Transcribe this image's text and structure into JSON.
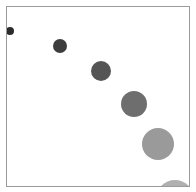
{
  "figure": {
    "background_color": "#ffffff",
    "width": 196,
    "height": 192
  },
  "plot_frame": {
    "border_color": "#9b9b9b",
    "border_width": 1,
    "x": 6,
    "y": 6,
    "width": 184,
    "height": 181,
    "background_color": "#ffffff"
  },
  "chart_data": {
    "type": "scatter",
    "title": "",
    "subtitle": "",
    "xlabel": "",
    "ylabel": "",
    "grid": false,
    "legend": "none",
    "axis_ticks": "none",
    "axis_tick_labels": "none",
    "xlim": [
      0,
      196
    ],
    "ylim": [
      192,
      0
    ],
    "marker": "circle",
    "note": "Six circular markers along a descending diagonal; marker size and lightness both increase from top-left to bottom-right. Last marker is clipped by the plot frame corner.",
    "points": [
      {
        "index": 1,
        "x": 10,
        "y": 31,
        "radius": 4.0,
        "diameter": 8,
        "color": "#2b2b2b"
      },
      {
        "index": 2,
        "x": 60,
        "y": 46,
        "radius": 7.0,
        "diameter": 14,
        "color": "#3d3d3d"
      },
      {
        "index": 3,
        "x": 101,
        "y": 71,
        "radius": 10.0,
        "diameter": 20,
        "color": "#555555"
      },
      {
        "index": 4,
        "x": 134,
        "y": 104,
        "radius": 13.0,
        "diameter": 26,
        "color": "#6e6e6e"
      },
      {
        "index": 5,
        "x": 158,
        "y": 144,
        "radius": 16.0,
        "diameter": 32,
        "color": "#9a9a9a"
      },
      {
        "index": 6,
        "x": 175,
        "y": 199,
        "radius": 19.0,
        "diameter": 38,
        "color": "#b0b0b0"
      }
    ]
  }
}
